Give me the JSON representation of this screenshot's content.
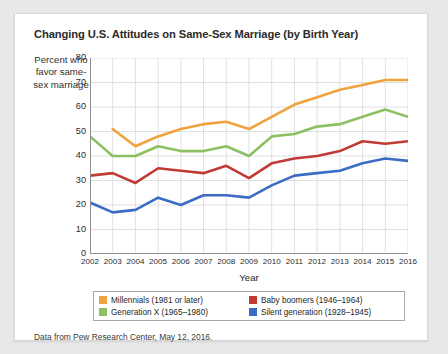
{
  "card": {
    "title": "Changing U.S. Attitudes on Same-Sex Marriage (by Birth Year)",
    "source_note": "Data from Pew Research Center, May 12, 2016."
  },
  "axis_caption": "Percent who favor same-sex marriage",
  "legend": {
    "items": [
      {
        "label": "Millennials (1981 or later)",
        "color": "#f0a23c"
      },
      {
        "label": "Baby boomers (1946–1964)",
        "color": "#c13b34"
      },
      {
        "label": "Generation X (1965–1980)",
        "color": "#8cc063"
      },
      {
        "label": "Silent generation (1928–1945)",
        "color": "#3b6bc4"
      }
    ]
  },
  "chart_data": {
    "type": "line",
    "title": "Changing U.S. Attitudes on Same-Sex Marriage (by Birth Year)",
    "xlabel": "Year",
    "ylabel": "Percent who favor same-sex marriage",
    "xlim": [
      2002,
      2016
    ],
    "ylim": [
      0,
      80
    ],
    "ytick_step": 10,
    "yticks": [
      0,
      10,
      20,
      30,
      40,
      50,
      60,
      70,
      80
    ],
    "grid": true,
    "legend_position": "bottom",
    "categories": [
      2002,
      2003,
      2004,
      2005,
      2006,
      2007,
      2008,
      2009,
      2010,
      2011,
      2012,
      2013,
      2014,
      2015,
      2016
    ],
    "series": [
      {
        "name": "Millennials (1981 or later)",
        "color": "#f0a23c",
        "start_year": 2003,
        "values": [
          null,
          51,
          44,
          48,
          51,
          53,
          54,
          51,
          56,
          61,
          64,
          67,
          69,
          71,
          71
        ]
      },
      {
        "name": "Generation X (1965–1980)",
        "color": "#8cc063",
        "start_year": 2002,
        "values": [
          48,
          40,
          40,
          44,
          42,
          42,
          44,
          40,
          48,
          49,
          52,
          53,
          56,
          59,
          56
        ]
      },
      {
        "name": "Baby boomers (1946–1964)",
        "color": "#c13b34",
        "start_year": 2002,
        "values": [
          32,
          33,
          29,
          35,
          34,
          33,
          36,
          31,
          37,
          39,
          40,
          42,
          46,
          45,
          46
        ]
      },
      {
        "name": "Silent generation (1928–1945)",
        "color": "#3b6bc4",
        "start_year": 2002,
        "values": [
          21,
          17,
          18,
          23,
          20,
          24,
          24,
          23,
          28,
          32,
          33,
          34,
          37,
          39,
          38
        ]
      }
    ]
  }
}
